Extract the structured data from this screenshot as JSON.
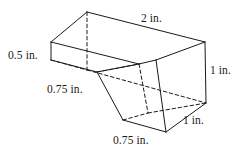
{
  "figure": {
    "kind": "geometry-diagram",
    "stroke_color": "#1a1a1a",
    "background_color": "#ffffff",
    "labels": {
      "top_length": "2 in.",
      "left_height": "0.5 in.",
      "right_height": "1 in.",
      "notch_top_width": "0.75 in.",
      "notch_bottom_width": "0.75 in.",
      "depth": "1 in."
    }
  }
}
